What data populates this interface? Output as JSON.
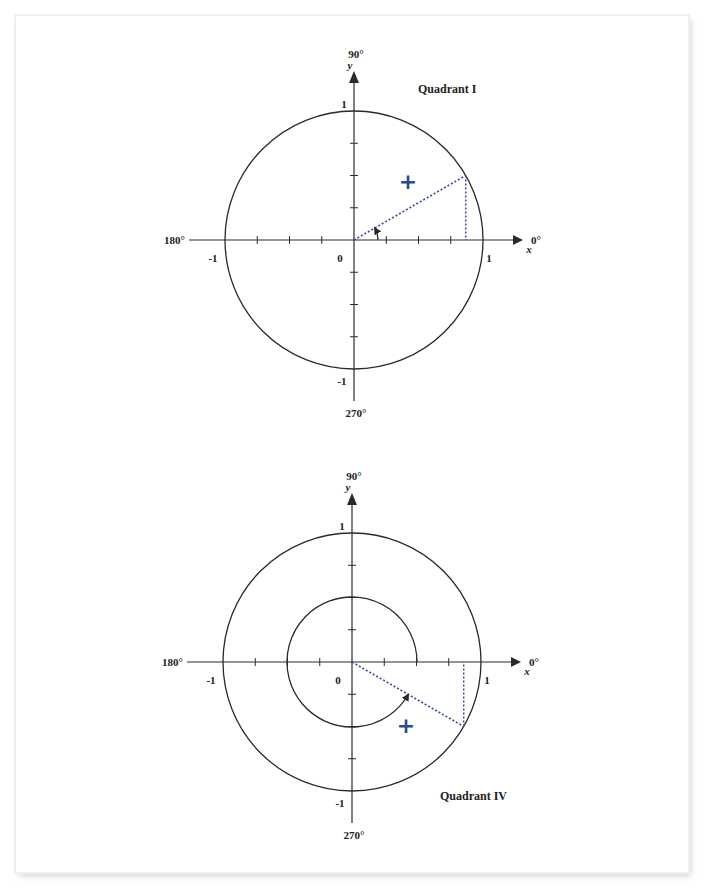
{
  "colors": {
    "ink": "#2a2a2a",
    "dotted": "#3a4f9a",
    "plus": "#2a4a8c"
  },
  "diagrams": [
    {
      "id": "quadrant-1",
      "title": "Quadrant I",
      "center": [
        354,
        240
      ],
      "radius": 129,
      "angle_deg": 30,
      "inner_arc_radius": 0,
      "small_arc_radius": 24,
      "sign": "+",
      "plus_pos": [
        408,
        183
      ],
      "title_pos": [
        418,
        93
      ],
      "labels": {
        "deg_90": "90°",
        "deg_0": "0°",
        "deg_180": "180°",
        "deg_270": "270°",
        "x_axis": "x",
        "y_axis": "y",
        "x_pos_one": "1",
        "x_neg_one": "-1",
        "y_pos_one": "1",
        "y_neg_one": "-1",
        "origin": "0"
      }
    },
    {
      "id": "quadrant-4",
      "title": "Quadrant IV",
      "center": [
        352,
        662
      ],
      "radius": 129,
      "angle_deg": -30,
      "inner_arc_radius": 65,
      "small_arc_radius": 0,
      "sign": "+",
      "plus_pos": [
        406,
        727
      ],
      "title_pos": [
        440,
        800
      ],
      "labels": {
        "deg_90": "90°",
        "deg_0": "0°",
        "deg_180": "180°",
        "deg_270": "270°",
        "x_axis": "x",
        "y_axis": "y",
        "x_pos_one": "1",
        "x_neg_one": "-1",
        "y_pos_one": "1",
        "y_neg_one": "-1",
        "origin": "0"
      }
    }
  ]
}
